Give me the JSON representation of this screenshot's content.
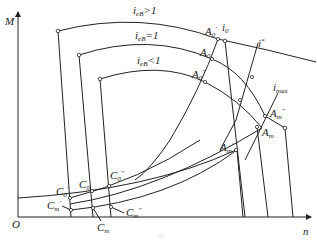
{
  "axes": {
    "y_label": "M",
    "x_label": "n",
    "origin_label": "O"
  },
  "curves": {
    "upper_label": "i",
    "upper_sub": "eB",
    "upper_rel": ">1",
    "middle_label": "i",
    "middle_sub": "eB",
    "middle_rel": "=1",
    "lower_label": "i",
    "lower_sub": "eB",
    "lower_rel": "<1"
  },
  "lines": {
    "i0": "i",
    "i0_sub": "0",
    "istar": "i",
    "istar_sup": "*",
    "imax": "i",
    "imax_sub": "max"
  },
  "points": {
    "A0_prime": {
      "base": "A",
      "sub": "0",
      "mark": "′"
    },
    "A0": {
      "base": "A",
      "sub": "0"
    },
    "A0_dprime": {
      "base": "A",
      "sub": "0",
      "mark": "″"
    },
    "Am_dprime": {
      "base": "A",
      "sub": "m",
      "mark": "″"
    },
    "Am": {
      "base": "A",
      "sub": "m"
    },
    "Am_prime": {
      "base": "A",
      "sub": "m",
      "mark": "′"
    },
    "C0_prime": {
      "base": "C",
      "sub": "0",
      "mark": "′"
    },
    "C0": {
      "base": "C",
      "sub": "0"
    },
    "C0_dprime": {
      "base": "C",
      "sub": "0",
      "mark": "″"
    },
    "Cm_prime": {
      "base": "C",
      "sub": "m",
      "mark": "′"
    },
    "Cm": {
      "base": "C",
      "sub": "m"
    },
    "Cm_dprime": {
      "base": "C",
      "sub": "m",
      "mark": "″"
    }
  },
  "caption": "图"
}
